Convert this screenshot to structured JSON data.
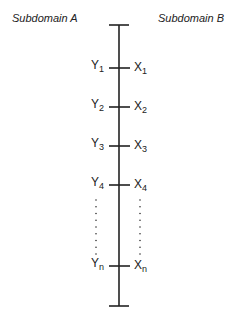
{
  "headings": {
    "left": "Subdomain A",
    "right": "Subdomain B"
  },
  "axis": {
    "x": 119,
    "top_y": 25,
    "bottom_y": 306,
    "cap_half_width": 10,
    "color": "#222222"
  },
  "pairs": [
    {
      "left": "Y",
      "left_sub": "1",
      "right": "X",
      "right_sub": "1",
      "y": 68
    },
    {
      "left": "Y",
      "left_sub": "2",
      "right": "X",
      "right_sub": "2",
      "y": 107
    },
    {
      "left": "Y",
      "left_sub": "3",
      "right": "X",
      "right_sub": "3",
      "y": 146
    },
    {
      "left": "Y",
      "left_sub": "4",
      "right": "X",
      "right_sub": "4",
      "y": 185
    },
    {
      "left": "Y",
      "left_sub": "n",
      "right": "X",
      "right_sub": "n",
      "y": 266
    }
  ],
  "ellipsis": {
    "left_x": 96,
    "right_x": 140,
    "from_y": 200,
    "to_y": 254,
    "dot_count": 9
  }
}
